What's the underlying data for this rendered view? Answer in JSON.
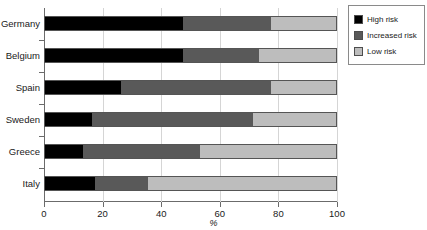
{
  "chart_data": {
    "type": "bar",
    "orientation": "horizontal",
    "stacked": true,
    "title": "",
    "xlabel": "%",
    "ylabel": "",
    "xlim": [
      0,
      100
    ],
    "xticks": [
      0,
      20,
      40,
      60,
      80,
      100
    ],
    "grid": true,
    "legend_position": "top-right",
    "categories": [
      "Germany",
      "Belgium",
      "Spain",
      "Sweden",
      "Greece",
      "Italy"
    ],
    "series": [
      {
        "name": "High risk",
        "color": "#000000",
        "values": [
          47,
          47,
          26,
          16,
          13,
          17
        ]
      },
      {
        "name": "Increased risk",
        "color": "#595959",
        "values": [
          30,
          26,
          51,
          55,
          40,
          18
        ]
      },
      {
        "name": "Low risk",
        "color": "#bdbdbd",
        "values": [
          23,
          27,
          23,
          29,
          47,
          65
        ]
      }
    ]
  },
  "legend": {
    "items": [
      {
        "label": "High risk"
      },
      {
        "label": "Increased risk"
      },
      {
        "label": "Low risk"
      }
    ]
  },
  "axis": {
    "x_title": "%",
    "tick_labels": [
      "0",
      "20",
      "40",
      "60",
      "80",
      "100"
    ]
  }
}
